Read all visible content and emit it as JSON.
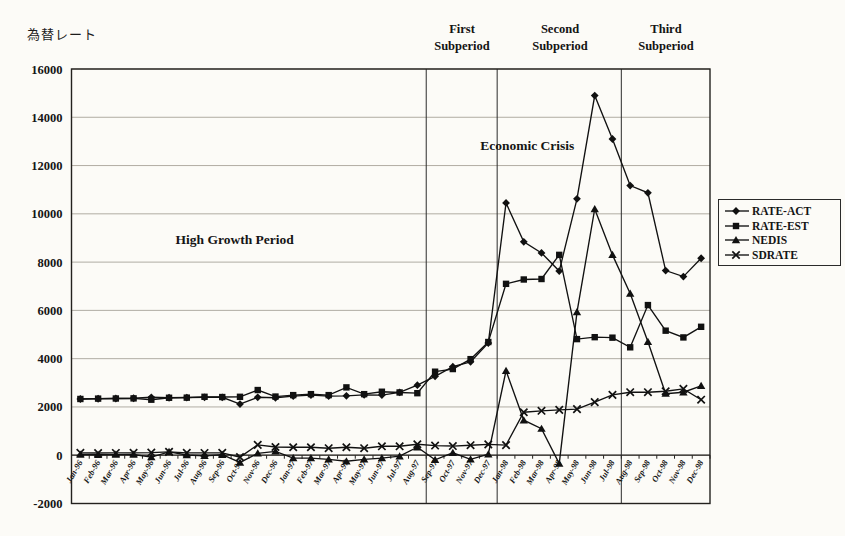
{
  "chart_data": {
    "type": "line",
    "title": "",
    "ylabel": "為替レート",
    "xlabel": "",
    "ylim": [
      -2000,
      16000
    ],
    "ytick_step": 2000,
    "grid": "horizontal",
    "legend_position": "right",
    "x_labels": [
      "Jan-96",
      "Feb-96",
      "Mar-96",
      "Apr-96",
      "May-96",
      "Jun-96",
      "Jul-96",
      "Aug-96",
      "Sep-96",
      "Oct-96",
      "Nov-96",
      "Dec-96",
      "Jan-97",
      "Feb-97",
      "Mar-97",
      "Apr-97",
      "May-97",
      "Jun-97",
      "Jul-97",
      "Aug-97",
      "Sep-97",
      "Oct-97",
      "Nov-97",
      "Dec-97",
      "Jan-98",
      "Feb-98",
      "Mar-98",
      "Apr-98",
      "May-98",
      "Jun-98",
      "Jul-98",
      "Aug-98",
      "Sep-98",
      "Oct-98",
      "Nov-98",
      "Dec-98"
    ],
    "series": [
      {
        "name": "RATE-ACT",
        "marker": "diamond",
        "color": "#111111",
        "values": [
          2330,
          2340,
          2350,
          2360,
          2400,
          2380,
          2390,
          2400,
          2400,
          2120,
          2400,
          2380,
          2450,
          2490,
          2450,
          2460,
          2500,
          2490,
          2600,
          2900,
          3270,
          3670,
          3870,
          4650,
          10450,
          8840,
          8380,
          7630,
          10620,
          14900,
          13100,
          11170,
          10870,
          7650,
          7400,
          8160
        ]
      },
      {
        "name": "RATE-EST",
        "marker": "square",
        "color": "#111111",
        "values": [
          2330,
          2345,
          2350,
          2355,
          2300,
          2380,
          2385,
          2420,
          2410,
          2420,
          2700,
          2430,
          2490,
          2530,
          2490,
          2810,
          2530,
          2630,
          2600,
          2570,
          3460,
          3570,
          3980,
          4690,
          7100,
          7280,
          7300,
          8300,
          4810,
          4890,
          4870,
          4470,
          6220,
          5160,
          4880,
          5320
        ]
      },
      {
        "name": "NEDIS",
        "marker": "triangle",
        "color": "#111111",
        "values": [
          30,
          20,
          25,
          30,
          -80,
          140,
          10,
          -20,
          20,
          -300,
          80,
          160,
          -120,
          -120,
          -170,
          -250,
          -170,
          -120,
          -40,
          330,
          -190,
          100,
          -170,
          40,
          3500,
          1450,
          1100,
          -350,
          5930,
          10200,
          8300,
          6700,
          4700,
          2550,
          2610,
          2875
        ]
      },
      {
        "name": "SDRATE",
        "marker": "x",
        "color": "#111111",
        "values": [
          100,
          90,
          95,
          100,
          110,
          140,
          100,
          95,
          100,
          -80,
          430,
          340,
          330,
          330,
          290,
          330,
          290,
          370,
          370,
          455,
          400,
          380,
          415,
          450,
          420,
          1780,
          1840,
          1880,
          1910,
          2200,
          2500,
          2610,
          2610,
          2650,
          2750,
          2300
        ]
      }
    ],
    "period_dividers": [
      {
        "before_month": "Sep-97"
      },
      {
        "before_month": "Jan-98"
      },
      {
        "before_month": "Aug-98"
      }
    ],
    "period_labels": [
      {
        "name": "First Subperiod",
        "lines": [
          "First",
          "Subperiod"
        ]
      },
      {
        "name": "Second Subperiod",
        "lines": [
          "Second",
          "Subperiod"
        ]
      },
      {
        "name": "Third Subperiod",
        "lines": [
          "Third",
          "Subperiod"
        ]
      }
    ],
    "annotations": [
      {
        "text": "High Growth Period",
        "x_index": 8.7,
        "y_value": 8950
      },
      {
        "text": "Economic Crisis",
        "x_index": 25.2,
        "y_value": 12850
      }
    ]
  }
}
